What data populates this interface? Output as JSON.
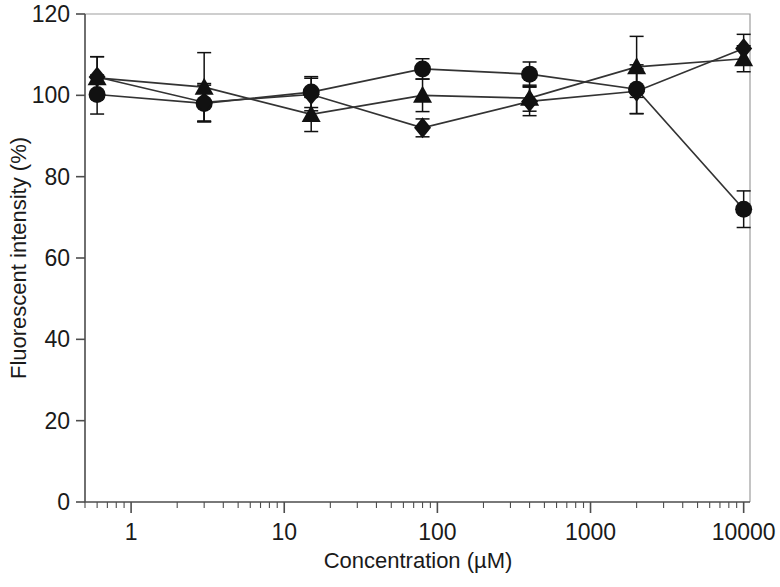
{
  "chart_data": {
    "type": "line",
    "title": "",
    "xlabel": "Concentration (µM)",
    "ylabel": "Fluorescent intensity (%)",
    "xscale": "log",
    "xlim": [
      0.5,
      11000
    ],
    "ylim": [
      0,
      120
    ],
    "yticks": [
      0,
      20,
      40,
      60,
      80,
      100,
      120
    ],
    "xticks": [
      1,
      10,
      100,
      1000,
      10000
    ],
    "xtick_labels": [
      "1",
      "10",
      "100",
      "1000",
      "10000"
    ],
    "grid": false,
    "legend": "none",
    "x": [
      0.6,
      3,
      15,
      80,
      400,
      2000,
      10000
    ],
    "series": [
      {
        "name": "series-circle",
        "marker": "circle",
        "values": [
          100.2,
          98.0,
          100.8,
          106.5,
          105.2,
          101.5,
          72.0
        ],
        "errors": [
          4.8,
          4.5,
          3.8,
          2.5,
          3.0,
          6.0,
          4.5
        ]
      },
      {
        "name": "series-diamond",
        "marker": "diamond",
        "values": [
          104.5,
          98.3,
          100.2,
          92.0,
          98.5,
          101.0,
          111.5
        ],
        "errors": [
          5.0,
          4.6,
          4.0,
          2.2,
          3.5,
          5.5,
          3.5
        ]
      },
      {
        "name": "series-triangle",
        "marker": "triangle",
        "values": [
          104.3,
          102.0,
          95.3,
          100.0,
          99.3,
          107.0,
          109.0
        ],
        "errors": [
          5.2,
          8.5,
          4.2,
          4.0,
          3.2,
          7.5,
          3.2
        ]
      }
    ]
  },
  "axis": {
    "ylabel": "Fluorescent intensity (%)",
    "xlabel": "Concentration (µM)",
    "ytick_0": "0",
    "ytick_20": "20",
    "ytick_40": "40",
    "ytick_60": "60",
    "ytick_80": "80",
    "ytick_100": "100",
    "ytick_120": "120",
    "xtick_1": "1",
    "xtick_10": "10",
    "xtick_100": "100",
    "xtick_1000": "1000",
    "xtick_10000": "10000"
  },
  "colors": {
    "axis": "#4d4d4d",
    "marker": "#111111",
    "line": "#333333",
    "text": "#1a1a1a",
    "background": "#ffffff"
  }
}
